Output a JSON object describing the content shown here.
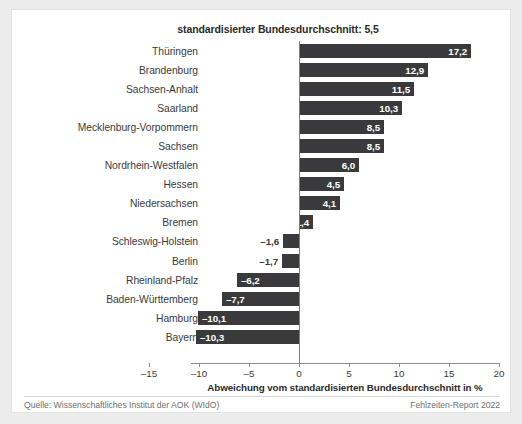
{
  "chart_data": {
    "type": "bar",
    "orientation": "horizontal",
    "title": "standardisierter Bundesdurchschnitt: 5,5",
    "xlabel": "Abweichung vom standardisierten Bundesdurchschnitt in %",
    "ylabel": "",
    "xlim": [
      -15,
      20
    ],
    "xticks": [
      "-15",
      "-10",
      "-5",
      "0",
      "5",
      "10",
      "15",
      "20"
    ],
    "xtick_values": [
      -15,
      -10,
      -5,
      0,
      5,
      10,
      15,
      20
    ],
    "grid": false,
    "legend": "none",
    "bar_color": "#3a3a3c",
    "categories": [
      "Thüringen",
      "Brandenburg",
      "Sachsen-Anhalt",
      "Saarland",
      "Mecklenburg-Vorpommern",
      "Sachsen",
      "Nordrhein-Westfalen",
      "Hessen",
      "Niedersachsen",
      "Bremen",
      "Schleswig-Holstein",
      "Berlin",
      "Rheinland-Pfalz",
      "Baden-Württemberg",
      "Hamburg",
      "Bayern"
    ],
    "values": [
      17.2,
      12.9,
      11.5,
      10.3,
      8.5,
      8.5,
      6.0,
      4.5,
      4.1,
      1.4,
      -1.6,
      -1.7,
      -6.2,
      -7.7,
      -10.1,
      -10.3
    ],
    "value_labels": [
      "17,2",
      "12,9",
      "11,5",
      "10,3",
      "8,5",
      "8,5",
      "6,0",
      "4,5",
      "4,1",
      "1,4",
      "–1,6",
      "–1,7",
      "–6,2",
      "–7,7",
      "–10,1",
      "–10,3"
    ],
    "reference_value": 5.5
  },
  "footer": {
    "source": "Quelle: Wissenschaftliches Institut der AOK (WIdO)",
    "report": "Fehlzeiten-Report 2022"
  }
}
